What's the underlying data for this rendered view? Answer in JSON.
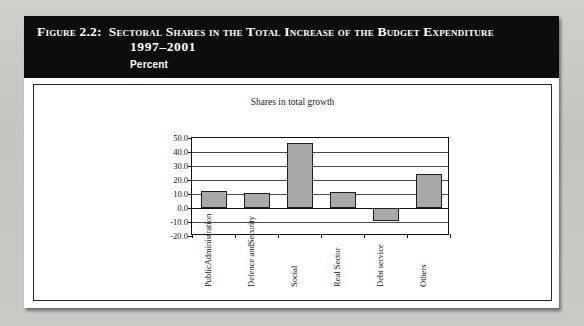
{
  "figure": {
    "label": "Figure 2.2:",
    "title": "Sectoral Shares in the Total Increase of the Budget Expenditure",
    "years": "1997–2001",
    "units": "Percent"
  },
  "chart_data": {
    "type": "bar",
    "title": "Shares in total growth",
    "xlabel": "",
    "ylabel": "",
    "categories": [
      "Public Administration",
      "Defence and Security",
      "Social",
      "Real Sector",
      "Debt service",
      "Others"
    ],
    "category_lines": [
      [
        "Public",
        "Administration"
      ],
      [
        "Defence and",
        "Security"
      ],
      [
        "Social"
      ],
      [
        "Real Sector"
      ],
      [
        "Debt service"
      ],
      [
        "Others"
      ]
    ],
    "values": [
      12.5,
      10.5,
      46.5,
      11.5,
      -9.5,
      24.5
    ],
    "ylim": [
      -20.0,
      50.0
    ],
    "ytick_step": 10.0,
    "yticks": [
      "50.0",
      "40.0",
      "30.0",
      "20.0",
      "10.0",
      "0.0",
      "-10.0",
      "-20.0"
    ],
    "ytick_values": [
      50.0,
      40.0,
      30.0,
      20.0,
      10.0,
      0.0,
      -10.0,
      -20.0
    ],
    "grid": true,
    "legend": false,
    "bar_color": "#a9a9a9",
    "bar_edge_color": "#1e1e1e"
  },
  "colors": {
    "header_background": "#0d0d0d",
    "header_text": "#ffffff",
    "figure_background": "#ffffff",
    "page_background": "#c9c9c4",
    "axis": "#111111"
  }
}
